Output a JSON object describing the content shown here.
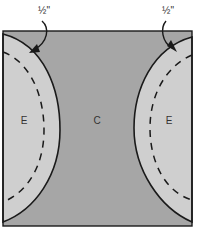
{
  "diagram": {
    "annotations": [
      {
        "id": "left-seam-label",
        "text": "½\""
      },
      {
        "id": "right-seam-label",
        "text": "½\""
      }
    ],
    "regions": [
      {
        "id": "left-piece",
        "label": "E"
      },
      {
        "id": "center-piece",
        "label": "C"
      },
      {
        "id": "right-piece",
        "label": "E"
      }
    ],
    "colors": {
      "center_fill": "#a6a6a6",
      "side_fill": "#cfcfcf",
      "stroke": "#1a1a1a"
    }
  }
}
